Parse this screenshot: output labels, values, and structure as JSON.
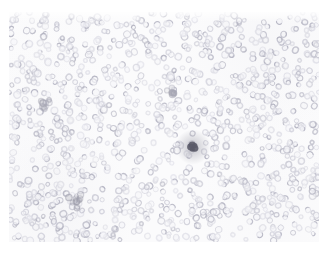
{
  "image": {
    "kind": "light-microscopy-micrograph",
    "specimen": "peripheral blood smear",
    "caption": "Peripheral blood smear showing a dense monolayer of red blood cells with central pallor",
    "width": 328,
    "height": 254,
    "background_color": "#ffffff"
  },
  "field": {
    "x": 9,
    "y": 12,
    "width": 310,
    "height": 230,
    "margin_color": "#ffffff"
  },
  "palette": {
    "background": "#ffffff",
    "field_wash": "#fbfbfc",
    "cell_rim_light": "#dcdce4",
    "cell_rim_mid": "#c9c9d4",
    "cell_rim_dark": "#b2b2c0",
    "cell_center": "#f6f6f9",
    "dense_patch": "#cfcfda",
    "leukocyte": "#5a5a68",
    "leukocyte_halo": "#8f8f9e",
    "platelet_clump": "#9a9aa8"
  },
  "cells": {
    "type": "erythrocytes",
    "approx_count": 1150,
    "diameter_px_min": 4.4,
    "diameter_px_max": 7.6,
    "morphology": "biconcave discs with pale centers (central pallor)",
    "ring_stroke_px": 1.1
  },
  "density_map": {
    "description": "relative cell density across the field, 0 = sparse, 1 = dense",
    "regions": [
      {
        "name": "top-left",
        "cx": 0.14,
        "cy": 0.12,
        "radius": 0.34,
        "density": 0.72
      },
      {
        "name": "top-center",
        "cx": 0.45,
        "cy": 0.1,
        "radius": 0.3,
        "density": 0.66
      },
      {
        "name": "top-right",
        "cx": 0.84,
        "cy": 0.14,
        "radius": 0.34,
        "density": 0.9
      },
      {
        "name": "mid-left",
        "cx": 0.1,
        "cy": 0.46,
        "radius": 0.3,
        "density": 0.78
      },
      {
        "name": "mid-center",
        "cx": 0.46,
        "cy": 0.44,
        "radius": 0.3,
        "density": 0.58
      },
      {
        "name": "mid-right",
        "cx": 0.86,
        "cy": 0.48,
        "radius": 0.3,
        "density": 0.74
      },
      {
        "name": "center-pale",
        "cx": 0.38,
        "cy": 0.7,
        "radius": 0.22,
        "density": 0.3
      },
      {
        "name": "bottom-left",
        "cx": 0.15,
        "cy": 0.86,
        "radius": 0.32,
        "density": 0.94
      },
      {
        "name": "bottom-center",
        "cx": 0.52,
        "cy": 0.9,
        "radius": 0.3,
        "density": 0.7
      },
      {
        "name": "bottom-right",
        "cx": 0.85,
        "cy": 0.86,
        "radius": 0.3,
        "density": 0.8
      }
    ]
  },
  "features": [
    {
      "id": "leukocyte-1",
      "label": "dark-stained leukocyte / platelet aggregate",
      "x": 193,
      "y": 147,
      "radius": 5.2,
      "color": "#5a5a68"
    },
    {
      "id": "dark-cluster-1",
      "label": "focal darker cell cluster",
      "x": 77,
      "y": 200,
      "radius": 9,
      "color": "#9a9aa8"
    },
    {
      "id": "dark-cluster-2",
      "label": "focal darker cell cluster",
      "x": 46,
      "y": 106,
      "radius": 7,
      "color": "#a6a6b4"
    },
    {
      "id": "dark-cluster-3",
      "label": "focal darker cell cluster",
      "x": 172,
      "y": 92,
      "radius": 6,
      "color": "#a9a9b6"
    }
  ],
  "overlays": {
    "scale_bar": null,
    "annotation_text": null,
    "magnification_label": null
  }
}
